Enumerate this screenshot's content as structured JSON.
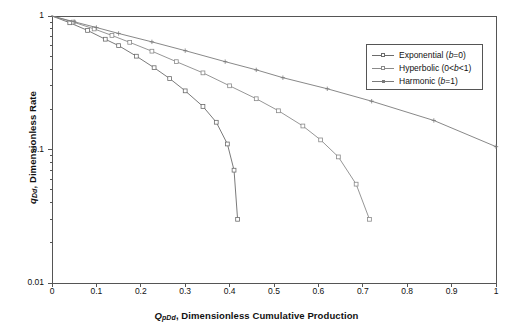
{
  "chart_data": {
    "type": "line",
    "title": "",
    "xlabel": "Q_pDd , Dimensionless Cumulative Production",
    "ylabel": "q_Dd , Dimensionless Rate",
    "xlabel_parts": {
      "symbol": "Q",
      "subscript": "pDd",
      "text": ", Dimensionless Cumulative Production"
    },
    "ylabel_parts": {
      "symbol": "q",
      "subscript": "Dd",
      "text": ", Dimensionless Rate"
    },
    "xscale": "linear",
    "yscale": "log",
    "xlim": [
      0,
      1
    ],
    "ylim": [
      0.01,
      1
    ],
    "grid": false,
    "legend_position": "upper-right",
    "xticks": [
      "0",
      "0.1",
      "0.2",
      "0.3",
      "0.4",
      "0.5",
      "0.6",
      "0.7",
      "0.8",
      "0.9",
      "1"
    ],
    "xtick_values": [
      0,
      0.1,
      0.2,
      0.3,
      0.4,
      0.5,
      0.6,
      0.7,
      0.8,
      0.9,
      1
    ],
    "yticks": [
      "1",
      "0.1",
      "0.01"
    ],
    "ytick_values": [
      1,
      0.1,
      0.01
    ],
    "series": [
      {
        "name": "Exponential (b=0)",
        "legend_parts": {
          "prefix": "Exponential (",
          "sym": "b",
          "suffix": "=0)"
        },
        "color": "#6b6b6b",
        "marker": "square-open",
        "points": [
          {
            "x": 0.0,
            "y": 1.0
          },
          {
            "x": 0.04,
            "y": 0.89
          },
          {
            "x": 0.08,
            "y": 0.78
          },
          {
            "x": 0.12,
            "y": 0.67
          },
          {
            "x": 0.15,
            "y": 0.6
          },
          {
            "x": 0.19,
            "y": 0.5
          },
          {
            "x": 0.23,
            "y": 0.41
          },
          {
            "x": 0.265,
            "y": 0.34
          },
          {
            "x": 0.3,
            "y": 0.275
          },
          {
            "x": 0.34,
            "y": 0.21
          },
          {
            "x": 0.37,
            "y": 0.16
          },
          {
            "x": 0.395,
            "y": 0.11
          },
          {
            "x": 0.41,
            "y": 0.07
          },
          {
            "x": 0.418,
            "y": 0.03
          }
        ]
      },
      {
        "name": "Hyperbolic (0<b<1)",
        "legend_parts": {
          "prefix": "Hyperbolic (0<",
          "sym": "b",
          "suffix": "<1)"
        },
        "color": "#8a8a8a",
        "marker": "square-open",
        "points": [
          {
            "x": 0.0,
            "y": 1.0
          },
          {
            "x": 0.048,
            "y": 0.9
          },
          {
            "x": 0.095,
            "y": 0.8
          },
          {
            "x": 0.135,
            "y": 0.715
          },
          {
            "x": 0.175,
            "y": 0.635
          },
          {
            "x": 0.225,
            "y": 0.545
          },
          {
            "x": 0.28,
            "y": 0.455
          },
          {
            "x": 0.34,
            "y": 0.375
          },
          {
            "x": 0.4,
            "y": 0.3
          },
          {
            "x": 0.46,
            "y": 0.24
          },
          {
            "x": 0.51,
            "y": 0.195
          },
          {
            "x": 0.565,
            "y": 0.15
          },
          {
            "x": 0.605,
            "y": 0.118
          },
          {
            "x": 0.645,
            "y": 0.088
          },
          {
            "x": 0.685,
            "y": 0.055
          },
          {
            "x": 0.715,
            "y": 0.03
          }
        ]
      },
      {
        "name": "Harmonic (b=1)",
        "legend_parts": {
          "prefix": "Harmonic (",
          "sym": "b",
          "suffix": "=1)"
        },
        "color": "#7a7a7a",
        "marker": "plus-open",
        "points": [
          {
            "x": 0.0,
            "y": 1.0
          },
          {
            "x": 0.05,
            "y": 0.905
          },
          {
            "x": 0.1,
            "y": 0.82
          },
          {
            "x": 0.15,
            "y": 0.74
          },
          {
            "x": 0.225,
            "y": 0.64
          },
          {
            "x": 0.3,
            "y": 0.55
          },
          {
            "x": 0.39,
            "y": 0.455
          },
          {
            "x": 0.46,
            "y": 0.395
          },
          {
            "x": 0.52,
            "y": 0.345
          },
          {
            "x": 0.62,
            "y": 0.285
          },
          {
            "x": 0.72,
            "y": 0.23
          },
          {
            "x": 0.86,
            "y": 0.165
          },
          {
            "x": 1.0,
            "y": 0.105
          }
        ]
      }
    ]
  },
  "axes": {
    "frame_color": "#555555",
    "plot_left": 52,
    "plot_right": 496,
    "plot_top": 16,
    "plot_bottom": 283
  }
}
